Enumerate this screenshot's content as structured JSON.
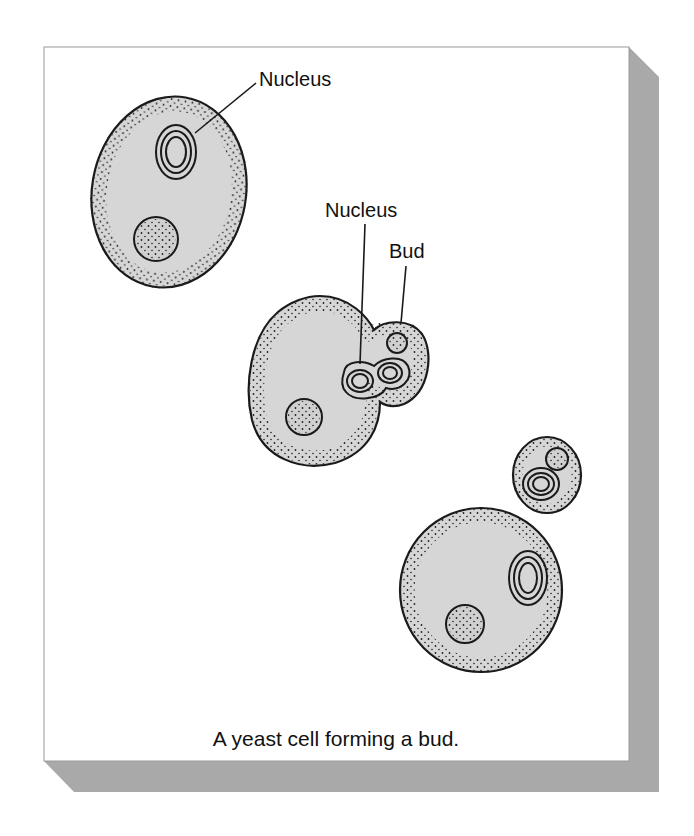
{
  "figure": {
    "caption": "A yeast cell forming a bud.",
    "colors": {
      "panel": "#ffffff",
      "panel_border": "#9a9a9a",
      "shadow": "#a9a9a9",
      "cytoplasm": "#d6d6d6",
      "outline": "#1a1a1a"
    }
  },
  "labels": {
    "nucleus_top": "Nucleus",
    "nucleus_middle": "Nucleus",
    "bud": "Bud"
  },
  "cells": [
    {
      "name": "parent-cell",
      "description": "Mature yeast cell with nucleus and vacuole"
    },
    {
      "name": "budding-cell",
      "description": "Cell with dividing nucleus and forming bud"
    },
    {
      "name": "daughter-cell",
      "description": "Separated bud (daughter cell)"
    },
    {
      "name": "mother-cell",
      "description": "Mother cell after bud separation"
    }
  ]
}
